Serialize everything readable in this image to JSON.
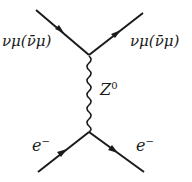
{
  "diagram": {
    "type": "feynman",
    "labels": {
      "top_left": "νμ(ν̄μ)",
      "top_right": "νμ(ν̄μ)",
      "boson": "Z",
      "boson_sup": "0",
      "bottom_left": "e",
      "bottom_left_sup": "−",
      "bottom_right": "e",
      "bottom_right_sup": "−"
    },
    "colors": {
      "line": "#1a1a1a",
      "background": "#ffffff"
    }
  }
}
